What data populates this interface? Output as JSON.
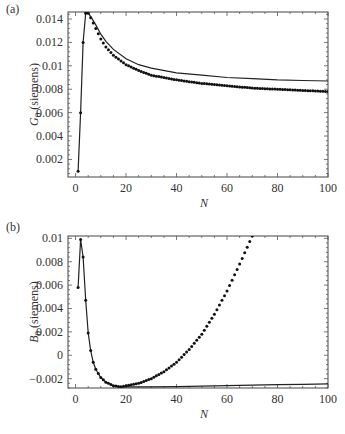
{
  "chart_data": [
    {
      "panel_label": "(a)",
      "type": "line",
      "title": "",
      "xlabel": "N",
      "ylabel_var": "G",
      "ylabel_sub": "0",
      "ylabel_unit": " (siemens)",
      "xlim": [
        -3,
        100
      ],
      "ylim": [
        0.0005,
        0.0146
      ],
      "xticks": [
        0,
        20,
        40,
        60,
        80,
        100
      ],
      "xtick_labels": [
        "0",
        "20",
        "40",
        "60",
        "80",
        "100"
      ],
      "yticks": [
        0.002,
        0.004,
        0.006,
        0.008,
        0.01,
        0.012,
        0.014
      ],
      "ytick_labels": [
        "0.002",
        "0.004",
        "0.006",
        "0.008",
        "0.01",
        "0.012",
        "0.014"
      ],
      "grid": false,
      "legend": null,
      "series": [
        {
          "name": "solid line (model)",
          "style": "line",
          "x": [
            1,
            2,
            3,
            4,
            5,
            6,
            8,
            10,
            12,
            15,
            20,
            25,
            30,
            40,
            50,
            60,
            70,
            80,
            90,
            100
          ],
          "values": [
            0.001,
            0.006,
            0.012,
            0.0145,
            0.0145,
            0.0142,
            0.0135,
            0.0127,
            0.0121,
            0.0114,
            0.0106,
            0.0101,
            0.0098,
            0.0094,
            0.0092,
            0.009,
            0.0089,
            0.0088,
            0.00875,
            0.0087
          ]
        },
        {
          "name": "dotted markers (data)",
          "style": "markers",
          "x": [
            1,
            2,
            3,
            4,
            5,
            6,
            8,
            10,
            12,
            15,
            20,
            25,
            30,
            40,
            50,
            60,
            70,
            80,
            90,
            100
          ],
          "values": [
            0.001,
            0.006,
            0.012,
            0.0145,
            0.0145,
            0.0141,
            0.0132,
            0.0123,
            0.0116,
            0.0109,
            0.0101,
            0.0096,
            0.0092,
            0.0088,
            0.0085,
            0.0083,
            0.0081,
            0.008,
            0.0079,
            0.0078
          ]
        }
      ]
    },
    {
      "panel_label": "(b)",
      "type": "line",
      "title": "",
      "xlabel": "N",
      "ylabel_var": "B",
      "ylabel_sub": "0",
      "ylabel_unit": " (siemens)",
      "xlim": [
        -3,
        100
      ],
      "ylim": [
        -0.0028,
        0.0102
      ],
      "xticks": [
        0,
        20,
        40,
        60,
        80,
        100
      ],
      "xtick_labels": [
        "0",
        "20",
        "40",
        "60",
        "80",
        "100"
      ],
      "yticks": [
        -0.002,
        0,
        0.002,
        0.004,
        0.006,
        0.008,
        0.01
      ],
      "ytick_labels": [
        "-0.002",
        "0",
        "0.002",
        "0.004",
        "0.006",
        "0.008",
        "0.01"
      ],
      "grid": false,
      "legend": null,
      "series": [
        {
          "name": "solid line (model)",
          "style": "line",
          "x": [
            1,
            2,
            3,
            4,
            5,
            6,
            7,
            8,
            10,
            12,
            15,
            18,
            20,
            25,
            30,
            40,
            50,
            60,
            70,
            80,
            90,
            100
          ],
          "values": [
            0.0058,
            0.0099,
            0.0084,
            0.0047,
            0.0019,
            0.0004,
            -0.0006,
            -0.0012,
            -0.0019,
            -0.0023,
            -0.0026,
            -0.0027,
            -0.0027,
            -0.0027,
            -0.0027,
            -0.00268,
            -0.00264,
            -0.0026,
            -0.00256,
            -0.00252,
            -0.00248,
            -0.00244
          ]
        },
        {
          "name": "dotted markers (data)",
          "style": "markers",
          "x": [
            1,
            2,
            3,
            4,
            5,
            6,
            7,
            8,
            10,
            12,
            15,
            18,
            20,
            25,
            30,
            35,
            40,
            45,
            50,
            55,
            60,
            65,
            70,
            72
          ],
          "values": [
            0.0058,
            0.0099,
            0.0084,
            0.0047,
            0.0019,
            0.0004,
            -0.0006,
            -0.0012,
            -0.0019,
            -0.0023,
            -0.0026,
            -0.0027,
            -0.0026,
            -0.0024,
            -0.002,
            -0.0014,
            -0.0006,
            0.0005,
            0.0018,
            0.0035,
            0.0055,
            0.0078,
            0.0102,
            0.0112
          ]
        }
      ]
    }
  ]
}
